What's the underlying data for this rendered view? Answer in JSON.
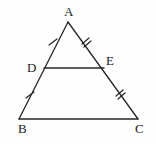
{
  "figure": {
    "kind": "geometry-diagram",
    "background_color": "#fefefe",
    "stroke_color": "#262626",
    "label_color": "#1b1b1b",
    "stroke_width": 1.3,
    "width": 156,
    "height": 144
  },
  "labels": {
    "a": "A",
    "b": "B",
    "c": "C",
    "d": "D",
    "e": "E"
  },
  "points": {
    "A": {
      "x": 68,
      "y": 22
    },
    "B": {
      "x": 19,
      "y": 119
    },
    "C": {
      "x": 138,
      "y": 119
    },
    "D": {
      "x": 44,
      "y": 68
    },
    "E": {
      "x": 104,
      "y": 68
    }
  },
  "segments": [
    {
      "name": "side-AB",
      "from": "A",
      "to": "B"
    },
    {
      "name": "side-AC",
      "from": "A",
      "to": "C"
    },
    {
      "name": "side-BC",
      "from": "B",
      "to": "C"
    },
    {
      "name": "midsegment-DE",
      "from": "D",
      "to": "E"
    }
  ],
  "tick_marks": [
    {
      "name": "tick-AD",
      "segment": "AD",
      "count": 1,
      "x": 53,
      "y": 42
    },
    {
      "name": "tick-AE",
      "segment": "AE",
      "count": 2,
      "x": 86,
      "y": 42
    },
    {
      "name": "tick-DB",
      "segment": "DB",
      "count": 1,
      "x": 30,
      "y": 95
    },
    {
      "name": "tick-EC",
      "segment": "EC",
      "count": 2,
      "x": 120,
      "y": 94
    }
  ]
}
